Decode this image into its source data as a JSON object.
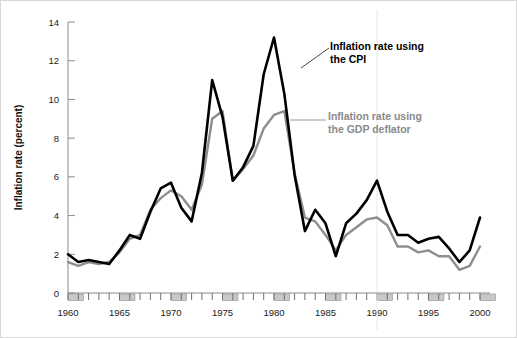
{
  "chart_data": {
    "type": "line",
    "title": "",
    "xlabel": "",
    "ylabel": "Inflation rate (percent)",
    "xlim": [
      1960,
      2000
    ],
    "ylim": [
      0,
      14
    ],
    "yticks": [
      0,
      2,
      4,
      6,
      8,
      10,
      12,
      14
    ],
    "xticks": [
      1960,
      1965,
      1970,
      1975,
      1980,
      1985,
      1990,
      1995,
      2000
    ],
    "xtick_labels": [
      "1960",
      "1965",
      "1970",
      "1975",
      "1980",
      "1985",
      "1990",
      "1995",
      "2000"
    ],
    "ytick_labels": [
      "0",
      "2",
      "4",
      "6",
      "8",
      "10",
      "12",
      "14"
    ],
    "minor_xtick_interval": 1,
    "grid": false,
    "legend_position": "inline-annotation",
    "x": [
      1960,
      1961,
      1962,
      1963,
      1964,
      1965,
      1966,
      1967,
      1968,
      1969,
      1970,
      1971,
      1972,
      1973,
      1974,
      1975,
      1976,
      1977,
      1978,
      1979,
      1980,
      1981,
      1982,
      1983,
      1984,
      1985,
      1986,
      1987,
      1988,
      1989,
      1990,
      1991,
      1992,
      1993,
      1994,
      1995,
      1996,
      1997,
      1998,
      1999,
      2000
    ],
    "series": [
      {
        "name": "Inflation rate using the CPI",
        "color": "#000000",
        "values": [
          2.0,
          1.6,
          1.7,
          1.6,
          1.5,
          2.2,
          3.0,
          2.8,
          4.2,
          5.4,
          5.7,
          4.4,
          3.7,
          6.2,
          11.0,
          9.1,
          5.8,
          6.5,
          7.6,
          11.3,
          13.2,
          10.3,
          6.1,
          3.2,
          4.3,
          3.6,
          1.9,
          3.6,
          4.1,
          4.8,
          5.8,
          4.2,
          3.0,
          3.0,
          2.6,
          2.8,
          2.9,
          2.3,
          1.6,
          2.2,
          3.9
        ],
        "annotation": "Inflation rate using\nthe CPI"
      },
      {
        "name": "Inflation rate using the GDP deflator",
        "color": "#8e8e8e",
        "values": [
          1.6,
          1.4,
          1.6,
          1.5,
          1.6,
          2.1,
          2.8,
          3.0,
          4.3,
          4.9,
          5.3,
          5.0,
          4.3,
          5.6,
          9.0,
          9.4,
          5.8,
          6.4,
          7.1,
          8.5,
          9.2,
          9.4,
          6.2,
          3.9,
          3.7,
          3.0,
          2.2,
          3.0,
          3.4,
          3.8,
          3.9,
          3.5,
          2.4,
          2.4,
          2.1,
          2.2,
          1.9,
          1.9,
          1.2,
          1.4,
          2.4
        ],
        "annotation": "Inflation rate using\nthe GDP deflator"
      }
    ],
    "recession_blocks": [
      1960,
      1965,
      1970,
      1975,
      1980,
      1985,
      1990,
      1995,
      2000
    ]
  },
  "annotations": {
    "cpi_label": "Inflation rate using\nthe CPI",
    "deflator_label": "Inflation rate using\nthe GDP deflator"
  },
  "colors": {
    "cpi": "#000000",
    "deflator": "#8e8e8e",
    "axis": "#8c8c8c",
    "recession": "#c9c9c9",
    "background": "#ffffff"
  }
}
